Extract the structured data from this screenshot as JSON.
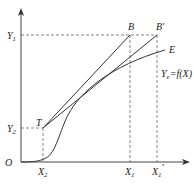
{
  "diagram": {
    "axes": {
      "origin_label": "O",
      "x_axis": "horizontal arrow",
      "y_axis": "vertical arrow"
    },
    "y_labels": {
      "y1": "Y",
      "y1_sub": "1",
      "y2": "Y",
      "y2_sub": "2"
    },
    "x_labels": {
      "x2": "X",
      "x2_sub": "2",
      "x1": "X",
      "x1_sub": "1",
      "x1p": "X",
      "x1p_sub": "1",
      "x1p_prime": "′"
    },
    "points": {
      "T": "T",
      "B": "B",
      "B_prime": "B′",
      "E": "E"
    },
    "curve_label": {
      "main": "Y",
      "sub": "e",
      "rest": "=f(X)"
    },
    "colors": {
      "line": "#333333",
      "dash": "#555555"
    }
  }
}
